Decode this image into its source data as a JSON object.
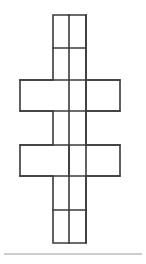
{
  "figure": {
    "kind": "net-diagram",
    "canvas": {
      "width": 146,
      "height": 264
    },
    "background_color": "#ffffff",
    "stroke_color": "#3a3a3a",
    "fill_color": "#ffffff",
    "stroke_width": 1.6,
    "column": {
      "left": 53,
      "right": 86
    },
    "band": {
      "left": 20,
      "right": 120
    },
    "faces": [
      {
        "name": "top-square",
        "x": 53,
        "y": 15,
        "w": 33,
        "h": 33
      },
      {
        "name": "upper-column-square",
        "x": 53,
        "y": 48,
        "w": 33,
        "h": 32
      },
      {
        "name": "upper-band-left-rect",
        "x": 20,
        "y": 80,
        "w": 66,
        "h": 31
      },
      {
        "name": "upper-band-right-rect",
        "x": 86,
        "y": 80,
        "w": 34,
        "h": 31
      },
      {
        "name": "middle-column-square",
        "x": 53,
        "y": 111,
        "w": 33,
        "h": 34
      },
      {
        "name": "lower-band-left-rect",
        "x": 20,
        "y": 145,
        "w": 49,
        "h": 31
      },
      {
        "name": "lower-band-right-rect",
        "x": 69,
        "y": 145,
        "w": 51,
        "h": 31
      },
      {
        "name": "lower-column-square",
        "x": 53,
        "y": 176,
        "w": 33,
        "h": 34
      },
      {
        "name": "bottom-square",
        "x": 53,
        "y": 210,
        "w": 33,
        "h": 33
      }
    ],
    "internal_edges": [
      {
        "name": "edge-top-square-bottom",
        "orientation": "horizontal",
        "x1": 53,
        "y1": 48,
        "x2": 86,
        "y2": 48
      },
      {
        "name": "edge-upper-band-top",
        "orientation": "horizontal",
        "x1": 20,
        "y1": 80,
        "x2": 120,
        "y2": 80
      },
      {
        "name": "edge-upper-band-bottom",
        "orientation": "horizontal",
        "x1": 20,
        "y1": 111,
        "x2": 120,
        "y2": 111
      },
      {
        "name": "edge-upper-band-divider",
        "orientation": "vertical",
        "x1": 86,
        "y1": 80,
        "x2": 86,
        "y2": 111
      },
      {
        "name": "edge-lower-band-top",
        "orientation": "horizontal",
        "x1": 20,
        "y1": 145,
        "x2": 120,
        "y2": 145
      },
      {
        "name": "edge-lower-band-bottom",
        "orientation": "horizontal",
        "x1": 20,
        "y1": 176,
        "x2": 120,
        "y2": 176
      },
      {
        "name": "edge-lower-band-divider",
        "orientation": "vertical",
        "x1": 69,
        "y1": 145,
        "x2": 69,
        "y2": 176
      },
      {
        "name": "edge-bottom-square-top",
        "orientation": "horizontal",
        "x1": 53,
        "y1": 210,
        "x2": 86,
        "y2": 210
      },
      {
        "name": "edge-column-left",
        "orientation": "vertical",
        "x1": 69,
        "y1": 15,
        "x2": 69,
        "y2": 243
      },
      {
        "name": "edge-column-right",
        "orientation": "vertical",
        "x1": 86,
        "y1": 15,
        "x2": 86,
        "y2": 243
      }
    ],
    "outline_path": "M53,15 L86,15 L86,80 L120,80 L120,111 L86,111 L86,145 L120,145 L120,176 L86,176 L86,243 L53,243 L53,176 L20,176 L20,145 L53,145 L53,111 L20,111 L20,80 L53,80 Z"
  },
  "footer": {
    "rule": {
      "name": "footer-separator",
      "x1": 4,
      "y1": 254,
      "x2": 142,
      "y2": 254,
      "color": "#9a9a9a",
      "thickness": 1
    }
  }
}
